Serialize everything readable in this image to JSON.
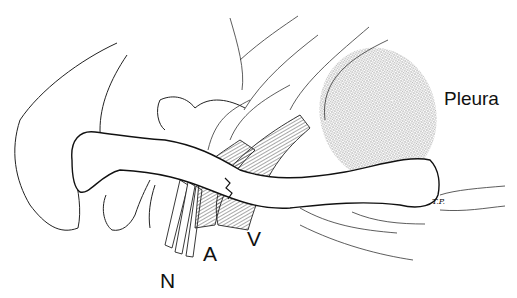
{
  "figure": {
    "labels": {
      "pleura": "Pleura",
      "nerve": "N",
      "artery": "A",
      "vein": "V"
    },
    "signature": "T.P."
  },
  "colors": {
    "ink": "#111111",
    "stipple": "#b5b5b5",
    "background": "#ffffff"
  }
}
